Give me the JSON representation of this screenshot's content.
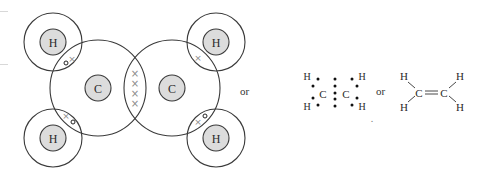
{
  "colors": {
    "line": "#3a3a3a",
    "nucleus_fill": "#dcdcdc",
    "cross": "#8a8a8a",
    "dot": "#111111"
  },
  "orbital_diagram": {
    "carbon_left": {
      "label": "C"
    },
    "carbon_right": {
      "label": "C"
    },
    "h_top_left": {
      "label": "H"
    },
    "h_bottom_left": {
      "label": "H"
    },
    "h_top_right": {
      "label": "H"
    },
    "h_bottom_right": {
      "label": "H"
    },
    "cc_shared_crosses": "×××× (4 shared electrons, double bond)",
    "ch_shared_pair": "× o"
  },
  "separators": {
    "or_1": "or",
    "or_2": "or"
  },
  "dot_structure": {
    "atoms": {
      "c1": "C",
      "c2": "C",
      "h_tl": "H",
      "h_bl": "H",
      "h_tr": "H",
      "h_br": "H"
    }
  },
  "structural_formula": {
    "atoms": {
      "c1": "C",
      "c2": "C",
      "h_tl": "H",
      "h_bl": "H",
      "h_tr": "H",
      "h_br": "H"
    },
    "double_bond": "═"
  },
  "footnote_mark": "."
}
